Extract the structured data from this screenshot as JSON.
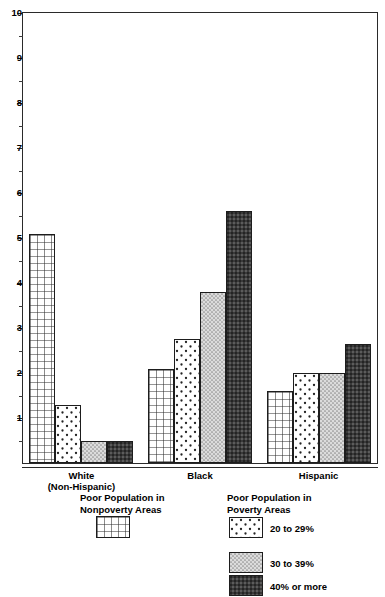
{
  "chart_data": {
    "type": "bar",
    "title": "",
    "subtitle": "",
    "xlabel": "",
    "ylabel": "",
    "ylim": [
      0,
      10
    ],
    "ytick_labels": [
      "10",
      "9",
      "8",
      "7",
      "6",
      "5",
      "4",
      "3",
      "2",
      "1"
    ],
    "ytick_values": [
      10,
      9,
      8,
      7,
      6,
      5,
      4,
      3,
      2,
      1
    ],
    "minor_ticks": [
      9.5,
      8.5,
      7.5,
      6.5,
      5.5,
      4.5,
      3.5,
      2.5,
      1.5,
      0.5
    ],
    "grid": false,
    "legend_position": "below-plot",
    "categories": [
      "White (Non-Hispanic)",
      "Black",
      "Hispanic"
    ],
    "category_labels": [
      {
        "line1": "White",
        "line2": "(Non-Hispanic)"
      },
      {
        "line1": "Black",
        "line2": ""
      },
      {
        "line1": "Hispanic",
        "line2": ""
      }
    ],
    "series": [
      {
        "name": "Poor Population in Nonpoverty Areas",
        "pattern": "crosshatch-grid",
        "values": [
          5.1,
          2.1,
          1.6
        ]
      },
      {
        "name": "20 to 29%",
        "pattern": "sparse-dots",
        "values": [
          1.3,
          2.75,
          2.0
        ]
      },
      {
        "name": "30 to 39%",
        "pattern": "light-stipple",
        "values": [
          0.5,
          3.8,
          2.0
        ]
      },
      {
        "name": "40% or more",
        "pattern": "dark-stipple",
        "values": [
          0.5,
          5.6,
          2.65
        ]
      }
    ]
  },
  "legend": {
    "nonpoverty": {
      "title": "Poor Population in\nNonpoverty Areas",
      "swatch_name": "crosshatch-grid-swatch"
    },
    "poverty": {
      "title": "Poor Population in\nPoverty Areas",
      "items": [
        {
          "label": "20 to 29%",
          "pattern": "sparse-dots"
        },
        {
          "label": "30 to 39%",
          "pattern": "light-stipple"
        },
        {
          "label": "40% or more",
          "pattern": "dark-stipple"
        }
      ]
    }
  },
  "colors": {
    "axis": "#2a2a2a",
    "bar_outline": "#1d1d1d",
    "text": "#000000",
    "background": "#ffffff",
    "light_stipple_fill": "#d0d0d0",
    "dark_stipple_fill": "#3b3b3b"
  }
}
